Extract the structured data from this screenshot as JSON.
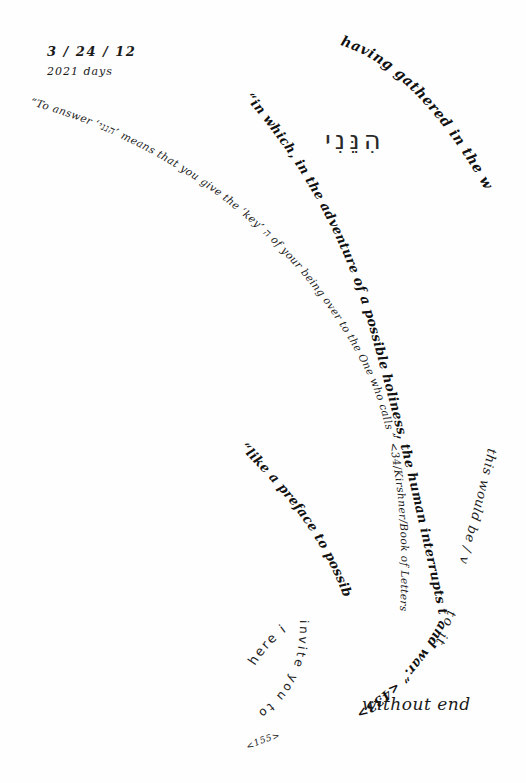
{
  "header": {
    "date": "3 / 24 / 12",
    "days": "2021 days"
  },
  "hebrew": {
    "word": "הִנֵּנִי"
  },
  "phrases": {
    "having_gathered": "having gathered in the word",
    "to_answer": "“To answer ‘הנני’ means that you give the ‘key’ ה of your being over to the One who calls ” <34/Kirshner/Book of Letters>",
    "in_which": "“in which, in the adventure of a possible holiness, the human interrupts the pure obstinacy of being",
    "being_continuation": "and war.” <433>",
    "like_a_preface": "“like a preface to possible research” <223>",
    "this_would_be": "this would be / ver",
    "to_it": "to it.",
    "here_i": "here i",
    "invite_you": "invite you to be",
    "without_end": "without end",
    "closing_ref": "<155>"
  }
}
